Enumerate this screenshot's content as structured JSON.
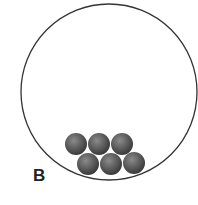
{
  "diagram": {
    "label": "B",
    "container": {
      "shape": "circle",
      "cx": 109,
      "cy": 92,
      "r": 88,
      "stroke": "#333333"
    },
    "balls": [
      {
        "cx": 76,
        "cy": 144,
        "r": 11
      },
      {
        "cx": 99,
        "cy": 144,
        "r": 11
      },
      {
        "cx": 122,
        "cy": 144,
        "r": 11
      },
      {
        "cx": 88,
        "cy": 164,
        "r": 11
      },
      {
        "cx": 111,
        "cy": 164,
        "r": 11
      },
      {
        "cx": 134,
        "cy": 163,
        "r": 11
      }
    ],
    "ball_color": "#555555"
  }
}
